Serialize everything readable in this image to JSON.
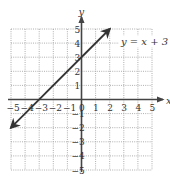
{
  "chart_data": {
    "type": "line",
    "title": "",
    "xlabel": "x",
    "ylabel": "y",
    "xlim": [
      -5,
      5
    ],
    "ylim": [
      -5,
      5
    ],
    "grid": true,
    "grid_style": "dotted",
    "x_ticks": [
      -5,
      -4,
      -3,
      -2,
      -1,
      0,
      1,
      2,
      3,
      4,
      5
    ],
    "y_ticks": [
      -5,
      -4,
      -3,
      -2,
      -1,
      1,
      2,
      3,
      4,
      5
    ],
    "x_tick_labels": [
      "−5",
      "−4",
      "−3",
      "−2",
      "−1",
      "0",
      "1",
      "2",
      "3",
      "4",
      "5"
    ],
    "y_tick_labels": [
      "−5",
      "−4",
      "−3",
      "−2",
      "−1",
      "1",
      "2",
      "3",
      "4",
      "5"
    ],
    "series": [
      {
        "name": "y = x + 3",
        "equation": "y = x + 3",
        "slope": 1,
        "intercept": 3,
        "x": [
          -5,
          -4,
          -3,
          -2,
          -1,
          0,
          1,
          2
        ],
        "y": [
          -2,
          -1,
          0,
          1,
          2,
          3,
          4,
          5
        ],
        "arrows": "both",
        "endpoints": [
          [
            -5,
            -2
          ],
          [
            2,
            5
          ]
        ]
      }
    ],
    "annotations": [
      {
        "text": "y = x + 3",
        "x": 2.8,
        "y": 3.9
      }
    ],
    "legend": null
  },
  "labels": {
    "x_axis": "x",
    "y_axis": "y",
    "equation": "y = x + 3"
  },
  "colors": {
    "line": "#333333",
    "axis": "#444444",
    "grid": "#9a9a9a",
    "text": "#333333",
    "background": "#ffffff"
  }
}
